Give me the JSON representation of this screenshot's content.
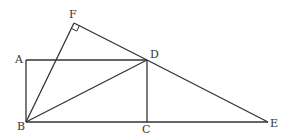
{
  "diagram": {
    "points": {
      "A": {
        "label": "A",
        "x": 26,
        "y": 60
      },
      "B": {
        "label": "B",
        "x": 26,
        "y": 122
      },
      "C": {
        "label": "C",
        "x": 147,
        "y": 122
      },
      "D": {
        "label": "D",
        "x": 147,
        "y": 60
      },
      "E": {
        "label": "E",
        "x": 268,
        "y": 122
      },
      "F": {
        "label": "F",
        "x": 74,
        "y": 23
      }
    },
    "segments": [
      "AB",
      "BC",
      "CE",
      "AD",
      "DC",
      "BD",
      "BF",
      "FD",
      "DE"
    ],
    "right_angle_at": "F",
    "line_color": "#333333"
  }
}
